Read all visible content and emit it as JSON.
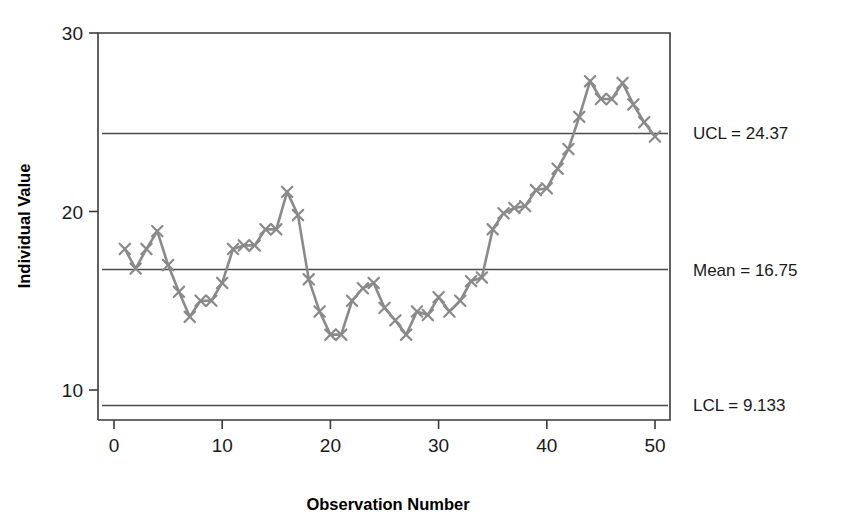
{
  "chart_data": {
    "type": "line",
    "title": "",
    "subtitle": "",
    "xlabel": "Observation Number",
    "ylabel": "Individual Value",
    "xlim": [
      0,
      51
    ],
    "ylim": [
      8.2,
      30.6
    ],
    "xticks": [
      0,
      10,
      20,
      30,
      40,
      50
    ],
    "xticklabels": [
      "0",
      "10",
      "20",
      "30",
      "40",
      "50"
    ],
    "yticks": [
      10,
      20,
      30
    ],
    "yticklabels": [
      "10",
      "20",
      "30"
    ],
    "grid": false,
    "legend": "none",
    "marker": "x",
    "series": [
      {
        "name": "Individual Value",
        "x": [
          1,
          2,
          3,
          4,
          5,
          6,
          7,
          8,
          9,
          10,
          11,
          12,
          13,
          14,
          15,
          16,
          17,
          18,
          19,
          20,
          21,
          22,
          23,
          24,
          25,
          26,
          27,
          28,
          29,
          30,
          31,
          32,
          33,
          34,
          35,
          36,
          37,
          38,
          39,
          40,
          41,
          42,
          43,
          44,
          45,
          46,
          47,
          48,
          49,
          50
        ],
        "values": [
          17.9,
          16.8,
          17.9,
          18.9,
          17.0,
          15.5,
          14.1,
          15.0,
          15.0,
          16.0,
          17.9,
          18.1,
          18.1,
          19.0,
          19.0,
          21.1,
          19.8,
          16.2,
          14.4,
          13.1,
          13.1,
          15.0,
          15.7,
          16.0,
          14.6,
          13.9,
          13.1,
          14.4,
          14.2,
          15.2,
          14.4,
          15.0,
          16.1,
          16.3,
          19.0,
          19.9,
          20.2,
          20.3,
          21.2,
          21.3,
          22.4,
          23.5,
          25.3,
          27.3,
          26.3,
          26.3,
          27.2,
          26.0,
          25.0,
          24.2
        ]
      }
    ],
    "control_lines": [
      {
        "id": "ucl",
        "label": "UCL = 24.37",
        "value": 24.37
      },
      {
        "id": "mean",
        "label": "Mean = 16.75",
        "value": 16.75
      },
      {
        "id": "lcl",
        "label": "LCL = 9.133",
        "value": 9.133
      }
    ],
    "colors": {
      "series": "#8a8a8a",
      "control_line": "#4a4a4a",
      "axis": "#3a3a3a",
      "text": "#1a1a1a",
      "background": "#ffffff"
    }
  }
}
